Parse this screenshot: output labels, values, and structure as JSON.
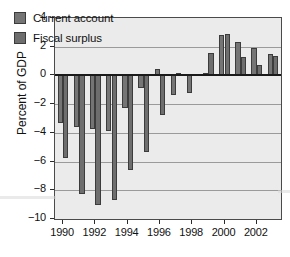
{
  "chart_data": {
    "type": "bar",
    "title": "",
    "subtitle": "",
    "xlabel": "",
    "ylabel": "Percent of GDP",
    "ylim": [
      -10,
      4
    ],
    "yticks": [
      4,
      2,
      0,
      -2,
      -4,
      -6,
      -8,
      -10
    ],
    "ytick_labels": [
      "4",
      "2",
      "0",
      "−2",
      "−4",
      "−6",
      "−8",
      "−10"
    ],
    "grid": true,
    "legend_position": "top-left",
    "x": [
      1990,
      1991,
      1992,
      1993,
      1994,
      1995,
      1996,
      1997,
      1998,
      1999,
      2000,
      2001,
      2002,
      2003
    ],
    "categories": [
      "1990",
      "1991",
      "1992",
      "1993",
      "1994",
      "1995",
      "1996",
      "1997",
      "1998",
      "1999",
      "2000",
      "2001",
      "2002",
      "2003"
    ],
    "xtick_labels": [
      "1990",
      "1992",
      "1994",
      "1996",
      "1998",
      "2000",
      "2002"
    ],
    "xticks": [
      1990,
      1992,
      1994,
      1996,
      1998,
      2000,
      2002
    ],
    "series": [
      {
        "name": "Current account",
        "color": "#757575",
        "values": [
          -3.3,
          -3.6,
          -3.7,
          -3.9,
          -2.3,
          -0.9,
          0.45,
          -1.35,
          -1.2,
          0.2,
          2.85,
          2.3,
          1.9,
          1.5
        ]
      },
      {
        "name": "Fiscal surplus",
        "color": "#6e6e6e",
        "values": [
          -5.75,
          -8.25,
          -9.0,
          -8.65,
          -6.6,
          -5.3,
          -2.75,
          0.15,
          0.1,
          1.55,
          2.9,
          1.3,
          0.75,
          1.35
        ]
      }
    ]
  },
  "legend": {
    "items": [
      {
        "label": "Current account",
        "color": "#757575"
      },
      {
        "label": "Fiscal surplus",
        "color": "#6e6e6e"
      }
    ]
  },
  "axes": {
    "y_title": "Percent of GDP"
  }
}
